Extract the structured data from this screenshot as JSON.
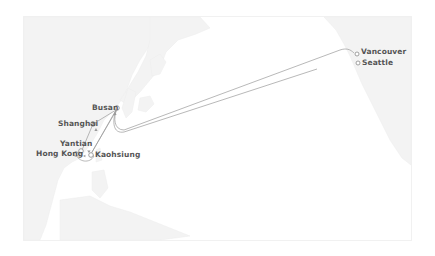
{
  "map": {
    "title": "Trans-Pacific shipping route",
    "colors": {
      "land": "#f2f2f2",
      "land_stroke": "#ececec",
      "route": "#9a9a9a",
      "port_stroke": "#8a8a8a",
      "label": "#555555",
      "background": "#ffffff"
    },
    "ports": [
      {
        "name": "Busan",
        "icon": "port-circle-icon"
      },
      {
        "name": "Shanghai",
        "icon": "port-circle-icon"
      },
      {
        "name": "Yantian",
        "icon": "port-circle-icon"
      },
      {
        "name": "Hong Kong",
        "icon": "port-circle-icon"
      },
      {
        "name": "Kaohsiung",
        "icon": "port-circle-icon"
      },
      {
        "name": "Vancouver",
        "icon": "port-circle-icon"
      },
      {
        "name": "Seattle",
        "icon": "port-circle-icon"
      }
    ],
    "route_order": [
      "Hong Kong",
      "Yantian",
      "Shanghai",
      "Busan",
      "Vancouver",
      "Seattle",
      "Busan",
      "Kaohsiung",
      "Hong Kong"
    ]
  }
}
